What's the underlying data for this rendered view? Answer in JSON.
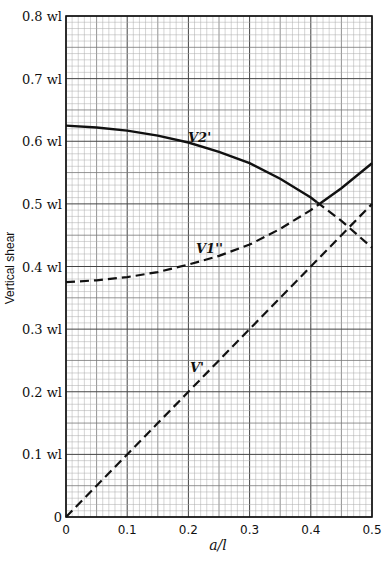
{
  "chart_data": {
    "type": "line",
    "title": "",
    "xlabel": "a/l",
    "ylabel": "Vertical shear",
    "xlim": [
      0,
      0.5
    ],
    "ylim": [
      0,
      0.8
    ],
    "grid": true,
    "x_ticks": [
      "0",
      "0.1",
      "0.2",
      "0.3",
      "0.4",
      "0.5"
    ],
    "y_ticks": [
      "0",
      "0.1 wl",
      "0.2 wl",
      "0.3 wl",
      "0.4 wl",
      "0.5 wl",
      "0.6 wl",
      "0.7 wl",
      "0.8 wl"
    ],
    "x": [
      0,
      0.05,
      0.1,
      0.15,
      0.2,
      0.25,
      0.3,
      0.35,
      0.4,
      0.45,
      0.5
    ],
    "series": [
      {
        "name": "V2'",
        "style": "solid to crossing (~0.41), dashed after",
        "values": [
          0.625,
          0.622,
          0.617,
          0.609,
          0.598,
          0.583,
          0.565,
          0.54,
          0.51,
          0.473,
          0.43
        ]
      },
      {
        "name": "V1''",
        "style": "dashed to crossing (~0.41), solid after",
        "values": [
          0.375,
          0.378,
          0.383,
          0.391,
          0.403,
          0.417,
          0.435,
          0.46,
          0.49,
          0.525,
          0.565
        ]
      },
      {
        "name": "V'",
        "style": "dashed",
        "values": [
          0,
          0.05,
          0.1,
          0.15,
          0.2,
          0.25,
          0.3,
          0.35,
          0.4,
          0.45,
          0.5
        ]
      }
    ],
    "annotations": [
      {
        "text": "V2'",
        "x": 0.22,
        "y": 0.6
      },
      {
        "text": "V1''",
        "x": 0.24,
        "y": 0.43
      },
      {
        "text": "V'",
        "x": 0.21,
        "y": 0.24
      }
    ]
  },
  "labels": {
    "ylabel": "Vertical shear",
    "xlabel": "a/l",
    "origin_y": "0",
    "curve_v2": "V2'",
    "curve_v1": "V1''",
    "curve_v": "V'"
  }
}
